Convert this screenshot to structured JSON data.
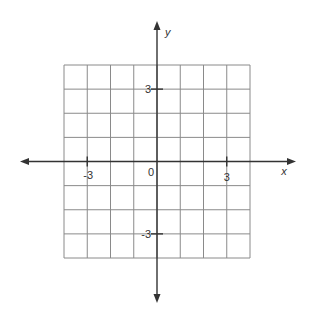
{
  "figure": {
    "type": "coordinate-grid",
    "x_range": [
      -4,
      4
    ],
    "y_range": [
      -4,
      4
    ],
    "grid_step": 1,
    "x_axis_label": "x",
    "y_axis_label": "y",
    "origin_label": "0",
    "x_tick_labels": [
      {
        "value": -3,
        "text": "-3"
      },
      {
        "value": 3,
        "text": "3"
      }
    ],
    "y_tick_labels": [
      {
        "value": 3,
        "text": "3"
      },
      {
        "value": -3,
        "text": "-3"
      }
    ],
    "colors": {
      "grid": "#8a8a8a",
      "axis": "#333333",
      "text": "#333333"
    }
  }
}
